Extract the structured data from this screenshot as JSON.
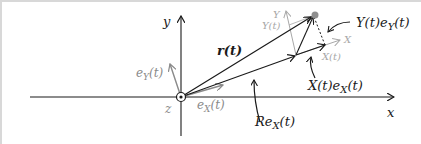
{
  "diagram": {
    "axes": {
      "x_label": "x",
      "y_label": "y",
      "z_label": "z"
    },
    "vectors": {
      "position": "r(t)",
      "radial": "Re",
      "radial_sub": "X",
      "radial_arg": "(t)",
      "x_comp": "X(t)e",
      "x_comp_sub": "X",
      "x_comp_arg": "(t)",
      "y_comp": "Y(t)e",
      "y_comp_sub": "Y",
      "y_comp_arg": "(t)"
    },
    "unit_vectors": {
      "eX": "e",
      "eX_sub": "X",
      "eX_arg": "(t)",
      "eY": "e",
      "eY_sub": "Y",
      "eY_arg": "(t)"
    },
    "rotating_frame": {
      "X_axis": "X",
      "Y_axis": "Y",
      "X_coord": "X(t)",
      "Y_coord": "Y(t)"
    },
    "colors": {
      "dark": "#1a1a1a",
      "grey": "#8a8a8a",
      "light": "#a8a8a8",
      "point": "#8f8f8f"
    }
  }
}
